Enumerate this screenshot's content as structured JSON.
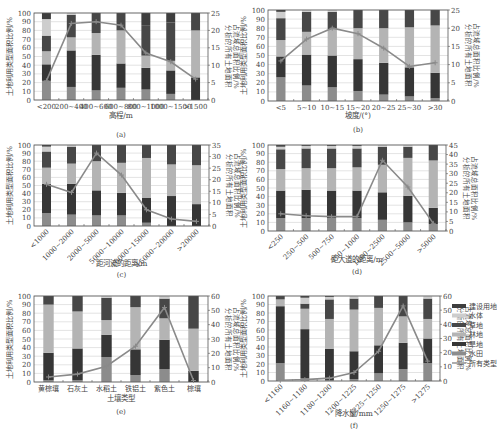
{
  "figure": {
    "left_ylabel": "土地利用类型面积比例/%",
    "right_ylabel_line1": "分析的所有土地面积",
    "right_ylabel_line2": "占流域总面积比例/%",
    "colors": {
      "paddy": "#8c8c8c",
      "dryland": "#363636",
      "forest": "#b4b4b4",
      "grass": "#474747",
      "water": "#cdcdcd",
      "built": "#3e3e3e",
      "line": "#8a8a8a",
      "grid": "#d0d0d0",
      "axis": "#555555"
    },
    "legend": [
      {
        "key": "built",
        "label": "建设用地"
      },
      {
        "key": "water",
        "label": "水体"
      },
      {
        "key": "grass",
        "label": "草地"
      },
      {
        "key": "forest",
        "label": "林地"
      },
      {
        "key": "dryland",
        "label": "旱地"
      },
      {
        "key": "paddy",
        "label": "水田"
      },
      {
        "key": "line",
        "label": "所有类型"
      }
    ]
  },
  "chart_data": [
    {
      "panel": "(a)",
      "type": "bar",
      "stacked": true,
      "title": "",
      "xlabel": "高程/m",
      "ylabel": "土地利用类型面积比例/%",
      "y2label": "分析的所有土地面积占流域总面积比例/%",
      "ylim": [
        0,
        100
      ],
      "y2lim": [
        0,
        25
      ],
      "y2ticks": [
        0,
        5,
        10,
        15,
        20,
        25
      ],
      "categories": [
        "<200",
        "200~400",
        "400~600",
        "600~800",
        "800~1000",
        "1000~1500",
        ">1500"
      ],
      "rotate_labels": false,
      "cumulative_tops": {
        "paddy": [
          22,
          15,
          11,
          14,
          12,
          7,
          0
        ],
        "dryland": [
          41,
          57,
          52,
          42,
          37,
          34,
          26
        ],
        "forest": [
          56,
          72,
          77,
          80,
          51,
          45,
          80
        ],
        "grass": [
          74,
          98,
          100,
          100,
          86,
          89,
          100
        ],
        "water": [
          93,
          100,
          100,
          100,
          86,
          89,
          100
        ],
        "built": [
          100,
          100,
          100,
          100,
          100,
          100,
          100
        ]
      },
      "line": {
        "name": "所有类型",
        "values": [
          5.5,
          22,
          22.5,
          21.5,
          13.5,
          11,
          6
        ]
      }
    },
    {
      "panel": "(b)",
      "type": "bar",
      "stacked": true,
      "title": "",
      "xlabel": "坡度/(°)",
      "ylabel": "土地利用类型面积比例/%",
      "y2label": "分析的所有土地面积占流域总面积比例/%",
      "ylim": [
        0,
        100
      ],
      "y2lim": [
        0,
        25
      ],
      "y2ticks": [
        0,
        5,
        10,
        15,
        20,
        25
      ],
      "categories": [
        "<5",
        "5~10",
        "10~15",
        "15~20",
        "20~25",
        "25~30",
        ">30"
      ],
      "rotate_labels": false,
      "cumulative_tops": {
        "paddy": [
          26,
          17,
          15,
          11,
          7,
          5,
          3
        ],
        "dryland": [
          49,
          51,
          50,
          46,
          42,
          37,
          31
        ],
        "forest": [
          67,
          76,
          79,
          80,
          80,
          81,
          83
        ],
        "grass": [
          91,
          98,
          98,
          100,
          100,
          100,
          100
        ],
        "water": [
          98,
          100,
          100,
          100,
          100,
          100,
          100
        ],
        "built": [
          100,
          100,
          100,
          100,
          100,
          100,
          100
        ]
      },
      "line": {
        "name": "所有类型",
        "values": [
          11,
          17,
          20,
          18.5,
          14.5,
          9.5,
          10.5
        ]
      }
    },
    {
      "panel": "(c)",
      "type": "bar",
      "stacked": true,
      "title": "",
      "xlabel": "距河流的距离/m",
      "ylabel": "土地利用类型面积比例/%",
      "y2label": "分析的所有土地面积占流域总面积比例/%",
      "ylim": [
        0,
        100
      ],
      "y2lim": [
        0,
        35
      ],
      "y2ticks": [
        0,
        5,
        10,
        15,
        20,
        25,
        30,
        35
      ],
      "categories": [
        "<1000",
        "1000~2000",
        "2000~5000",
        "5000~10000",
        "10000~15000",
        "15000~20000",
        ">20000"
      ],
      "rotate_labels": true,
      "cumulative_tops": {
        "paddy": [
          16,
          14,
          13,
          13,
          4,
          0,
          0
        ],
        "dryland": [
          52,
          52,
          44,
          41,
          35,
          37,
          27
        ],
        "forest": [
          72,
          77,
          80,
          78,
          84,
          76,
          75
        ],
        "grass": [
          92,
          98,
          100,
          100,
          100,
          100,
          100
        ],
        "water": [
          98,
          100,
          100,
          100,
          100,
          100,
          100
        ],
        "built": [
          100,
          100,
          100,
          100,
          100,
          100,
          100
        ]
      },
      "line": {
        "name": "所有类型",
        "values": [
          18,
          14.5,
          31.5,
          22,
          7,
          3,
          2
        ]
      }
    },
    {
      "panel": "(d)",
      "type": "bar",
      "stacked": true,
      "title": "",
      "xlabel": "距大道的距离/m",
      "ylabel": "土地利用类型面积比例/%",
      "y2label": "分析的所有土地面积占流域总面积比例/%",
      "ylim": [
        0,
        100
      ],
      "y2lim": [
        0,
        45
      ],
      "y2ticks": [
        0,
        5,
        10,
        15,
        20,
        25,
        30,
        35,
        40,
        45
      ],
      "categories": [
        "<250",
        "250~500",
        "500~750",
        "750~1000",
        "1000~2500",
        "2500~5000",
        ">5000"
      ],
      "rotate_labels": true,
      "cumulative_tops": {
        "paddy": [
          15,
          15,
          15,
          15,
          13,
          10,
          8
        ],
        "dryland": [
          47,
          48,
          47,
          47,
          45,
          41,
          27
        ],
        "forest": [
          72,
          73,
          73,
          74,
          77,
          85,
          82
        ],
        "grass": [
          95,
          96,
          96,
          96,
          98,
          98,
          100
        ],
        "water": [
          98,
          99,
          99,
          99,
          100,
          100,
          100
        ],
        "built": [
          100,
          100,
          100,
          100,
          100,
          100,
          100
        ]
      },
      "line": {
        "name": "所有类型",
        "values": [
          9,
          8,
          7.5,
          7.5,
          37,
          23,
          4
        ]
      }
    },
    {
      "panel": "(e)",
      "type": "bar",
      "stacked": true,
      "title": "",
      "xlabel": "土壤类型",
      "ylabel": "土地利用类型面积比例/%",
      "y2label": "分析的所有土地面积占流域总面积比例/%",
      "ylim": [
        0,
        100
      ],
      "y2lim": [
        0,
        60
      ],
      "y2ticks": [
        0,
        10,
        20,
        30,
        40,
        50,
        60
      ],
      "categories": [
        "黄棕壤",
        "石灰土",
        "水稻土",
        "铁铝土",
        "紫色土",
        "棕壤"
      ],
      "rotate_labels": false,
      "cumulative_tops": {
        "paddy": [
          2,
          2,
          29,
          8,
          15,
          0
        ],
        "dryland": [
          34,
          39,
          55,
          38,
          49,
          13
        ],
        "forest": [
          90,
          82,
          72,
          87,
          74,
          62
        ],
        "grass": [
          100,
          100,
          98,
          100,
          97,
          100
        ],
        "water": [
          100,
          100,
          100,
          100,
          100,
          100
        ],
        "built": [
          100,
          100,
          100,
          100,
          100,
          100
        ]
      },
      "line": {
        "name": "所有类型",
        "values": [
          3.5,
          5.5,
          11,
          25,
          52,
          1
        ]
      }
    },
    {
      "panel": "(f)",
      "type": "bar",
      "stacked": true,
      "title": "",
      "xlabel": "降水量/mm",
      "ylabel": "土地利用类型面积比例/%",
      "y2label": "分析的所有土地面积占流域总面积比例/%",
      "ylim": [
        0,
        100
      ],
      "y2lim": [
        0,
        60
      ],
      "y2ticks": [
        0,
        10,
        20,
        30,
        40,
        50,
        60
      ],
      "categories": [
        "<1160",
        "1160~1180",
        "1180~1200",
        "1200~1225",
        "1225~1250",
        "1250~1275",
        ">1275"
      ],
      "rotate_labels": true,
      "cumulative_tops": {
        "paddy": [
          21,
          3,
          1,
          2,
          9,
          14,
          21
        ],
        "dryland": [
          88,
          61,
          38,
          35,
          42,
          45,
          50
        ],
        "forest": [
          96,
          85,
          73,
          84,
          86,
          76,
          73
        ],
        "grass": [
          100,
          91,
          96,
          97,
          100,
          100,
          97
        ],
        "water": [
          100,
          98,
          99,
          100,
          100,
          100,
          100
        ],
        "built": [
          100,
          100,
          100,
          100,
          100,
          100,
          100
        ]
      },
      "line": {
        "name": "所有类型",
        "values": [
          0.5,
          1,
          2,
          6,
          21,
          53,
          14
        ]
      }
    }
  ]
}
